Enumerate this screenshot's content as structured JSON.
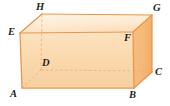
{
  "figure": {
    "name": "rectangular-prism",
    "type": "3d-solid-diagram",
    "background_color": "#ffffff"
  },
  "colors": {
    "front_face": "#FAD9AE",
    "top_face": "#FDEBD3",
    "right_face": "#F5B978",
    "edge_outline": "#E8954A",
    "hidden_edge": "#E0A878",
    "label_text": "#231f20"
  },
  "solid": {
    "front_face_label": "ABFE",
    "top_face_label": "EFGH",
    "right_face_label": "BCGF",
    "hidden_vertex": "D"
  },
  "vertices": [
    {
      "id": "A",
      "label": "A",
      "x": 22,
      "y": 88,
      "label_x": 10,
      "label_y": 89,
      "hidden": false,
      "position": "bottom-front-left"
    },
    {
      "id": "B",
      "label": "B",
      "x": 134,
      "y": 88,
      "label_x": 129,
      "label_y": 90,
      "hidden": false,
      "position": "bottom-front-right"
    },
    {
      "id": "C",
      "label": "C",
      "x": 152,
      "y": 72,
      "label_x": 155,
      "label_y": 67,
      "hidden": false,
      "position": "bottom-back-right"
    },
    {
      "id": "D",
      "label": "D",
      "x": 41,
      "y": 70,
      "label_x": 42,
      "label_y": 58,
      "hidden": true,
      "position": "bottom-back-left"
    },
    {
      "id": "E",
      "label": "E",
      "x": 20,
      "y": 33,
      "label_x": 8,
      "label_y": 27,
      "hidden": false,
      "position": "top-front-left"
    },
    {
      "id": "F",
      "label": "F",
      "x": 133,
      "y": 32,
      "label_x": 124,
      "label_y": 33,
      "hidden": false,
      "position": "top-front-right"
    },
    {
      "id": "G",
      "label": "G",
      "x": 152,
      "y": 15,
      "label_x": 153,
      "label_y": 3,
      "hidden": false,
      "position": "top-back-right"
    },
    {
      "id": "H",
      "label": "H",
      "x": 42,
      "y": 14,
      "label_x": 36,
      "label_y": 2,
      "hidden": false,
      "position": "top-back-left"
    }
  ],
  "edges": [
    {
      "from": "A",
      "to": "B",
      "hidden": false
    },
    {
      "from": "B",
      "to": "F",
      "hidden": false
    },
    {
      "from": "F",
      "to": "E",
      "hidden": false
    },
    {
      "from": "E",
      "to": "A",
      "hidden": false
    },
    {
      "from": "E",
      "to": "H",
      "hidden": false
    },
    {
      "from": "H",
      "to": "G",
      "hidden": false
    },
    {
      "from": "G",
      "to": "F",
      "hidden": false
    },
    {
      "from": "B",
      "to": "C",
      "hidden": false
    },
    {
      "from": "C",
      "to": "G",
      "hidden": false
    },
    {
      "from": "A",
      "to": "D",
      "hidden": true
    },
    {
      "from": "D",
      "to": "C",
      "hidden": true
    },
    {
      "from": "D",
      "to": "H",
      "hidden": true
    }
  ]
}
